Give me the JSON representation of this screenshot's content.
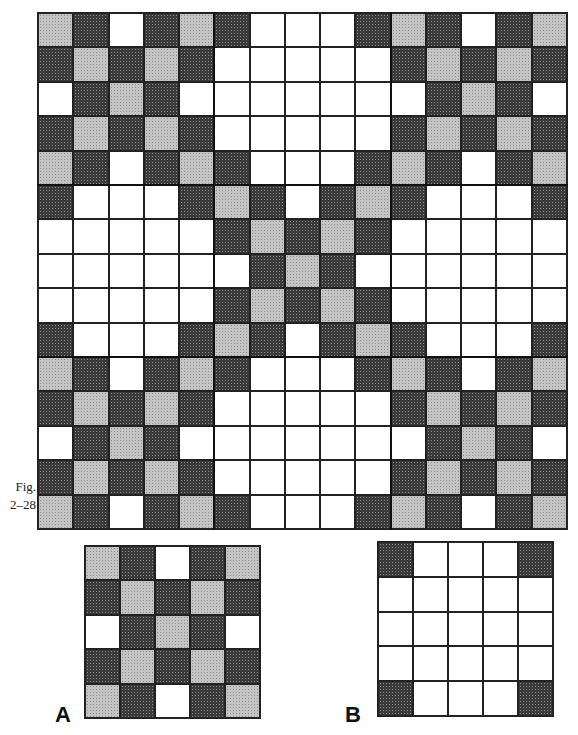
{
  "figure": {
    "caption_line1": "Fig.",
    "caption_line2": "2–28",
    "label_a": "A",
    "label_b": "B"
  },
  "colors": {
    "dark": "#3a3a3a",
    "light": "#c4c4c4",
    "white": "#ffffff",
    "line": "#222222"
  },
  "blocks": {
    "A": [
      [
        "L",
        "D",
        "W",
        "D",
        "L"
      ],
      [
        "D",
        "L",
        "D",
        "L",
        "D"
      ],
      [
        "W",
        "D",
        "L",
        "D",
        "W"
      ],
      [
        "D",
        "L",
        "D",
        "L",
        "D"
      ],
      [
        "L",
        "D",
        "W",
        "D",
        "L"
      ]
    ],
    "B": [
      [
        "D",
        "W",
        "W",
        "W",
        "D"
      ],
      [
        "W",
        "W",
        "W",
        "W",
        "W"
      ],
      [
        "W",
        "W",
        "W",
        "W",
        "W"
      ],
      [
        "W",
        "W",
        "W",
        "W",
        "W"
      ],
      [
        "D",
        "W",
        "W",
        "W",
        "D"
      ]
    ]
  },
  "main_layout": [
    [
      "A",
      "B",
      "A"
    ],
    [
      "B",
      "A",
      "B"
    ],
    [
      "A",
      "B",
      "A"
    ]
  ]
}
